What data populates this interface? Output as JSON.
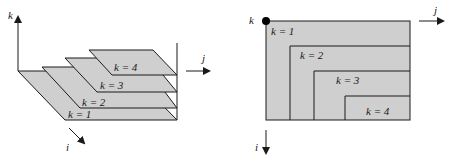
{
  "left_diagram": {
    "axes": {
      "k": "k",
      "j": "j",
      "i": "i"
    },
    "planes": [
      {
        "label": "k = 1"
      },
      {
        "label": "k = 2"
      },
      {
        "label": "k = 3"
      },
      {
        "label": "k = 4"
      }
    ]
  },
  "right_diagram": {
    "axes": {
      "k": "k",
      "j": "j",
      "i": "i"
    },
    "regions": [
      {
        "label": "k = 1"
      },
      {
        "label": "k = 2"
      },
      {
        "label": "k = 3"
      },
      {
        "label": "k = 4"
      }
    ]
  },
  "colors": {
    "plane_fill": "#cfcfcf",
    "stroke": "#1a1a1a",
    "background": "#ffffff"
  }
}
